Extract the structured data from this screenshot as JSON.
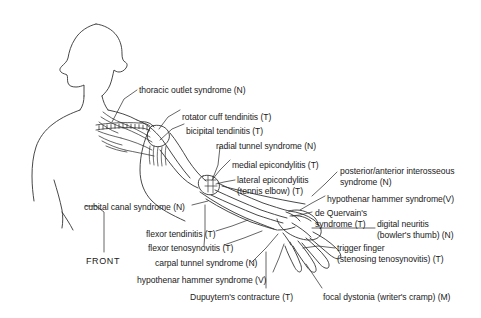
{
  "figure": {
    "view_label": "FRONT",
    "stroke_color": "#333333",
    "background_color": "#ffffff",
    "body_part_names": [
      "head-profile",
      "neck",
      "torso-outline",
      "clavicle",
      "brachial-plexus",
      "shoulder-joint",
      "humerus",
      "elbow-joint",
      "forearm",
      "wrist",
      "hand-fingers"
    ]
  },
  "annotations": [
    {
      "id": "thoracic-outlet-syndrome",
      "lines": [
        "thoracic outlet syndrome (N)"
      ],
      "x": 139,
      "y": 85,
      "align": "left"
    },
    {
      "id": "rotator-cuff-tendinitis",
      "lines": [
        "rotator cuff tendinitis (T)"
      ],
      "x": 182,
      "y": 112,
      "align": "left"
    },
    {
      "id": "bicipital-tendinitis",
      "lines": [
        "bicipital tendinitis (T)"
      ],
      "x": 186,
      "y": 126,
      "align": "left"
    },
    {
      "id": "radial-tunnel-syndrome",
      "lines": [
        "radial tunnel syndrome (N)"
      ],
      "x": 216,
      "y": 141,
      "align": "left"
    },
    {
      "id": "medial-epicondylitis",
      "lines": [
        "medial epicondylitis (T)"
      ],
      "x": 232,
      "y": 160,
      "align": "left"
    },
    {
      "id": "lateral-epicondylitis",
      "lines": [
        "lateral epicondylitis",
        "(tennis elbow) (T)"
      ],
      "x": 237,
      "y": 175,
      "align": "left"
    },
    {
      "id": "posterior-anterior-interosseous-syndrome",
      "lines": [
        "posterior/anterior interosseous",
        "syndrome (N)"
      ],
      "x": 340,
      "y": 166,
      "align": "left"
    },
    {
      "id": "hypothenar-hammer-syndrome-v-upper",
      "lines": [
        "hypothenar hammer syndrome(V)"
      ],
      "x": 327,
      "y": 194,
      "align": "left"
    },
    {
      "id": "de-quervains-syndrome",
      "lines": [
        "de Quervain's",
        "syndrome (T)"
      ],
      "x": 315,
      "y": 208,
      "align": "left"
    },
    {
      "id": "digital-neuritis",
      "lines": [
        "digital neuritis",
        "(bowler's thumb) (N)"
      ],
      "x": 377,
      "y": 219,
      "align": "left"
    },
    {
      "id": "trigger-finger",
      "lines": [
        "trigger finger",
        "(stenosing tenosynovitis) (T)"
      ],
      "x": 337,
      "y": 243,
      "align": "left"
    },
    {
      "id": "cubital-canal-syndrome",
      "lines": [
        "cubital canal syndrome (N)"
      ],
      "x": 84,
      "y": 202,
      "align": "left"
    },
    {
      "id": "flexor-tendinitis",
      "lines": [
        "flexor tendinitis (T)"
      ],
      "x": 146,
      "y": 229,
      "align": "left"
    },
    {
      "id": "flexor-tenosynovitis",
      "lines": [
        "flexor tenosynovitis (T)"
      ],
      "x": 148,
      "y": 243,
      "align": "left"
    },
    {
      "id": "carpal-tunnel-syndrome",
      "lines": [
        "carpal tunnel syndrome (N)"
      ],
      "x": 155,
      "y": 258,
      "align": "left"
    },
    {
      "id": "hypothenar-hammer-syndrome-v-lower",
      "lines": [
        "hypothenar hammer syndrome (V)"
      ],
      "x": 137,
      "y": 275,
      "align": "left"
    },
    {
      "id": "dupuytrens-contracture",
      "lines": [
        "Dupuytern's contracture (T)"
      ],
      "x": 190,
      "y": 292,
      "align": "left"
    },
    {
      "id": "focal-dystonia",
      "lines": [
        "focal dystonia (writer's cramp) (M)"
      ],
      "x": 323,
      "y": 292,
      "align": "left"
    }
  ]
}
